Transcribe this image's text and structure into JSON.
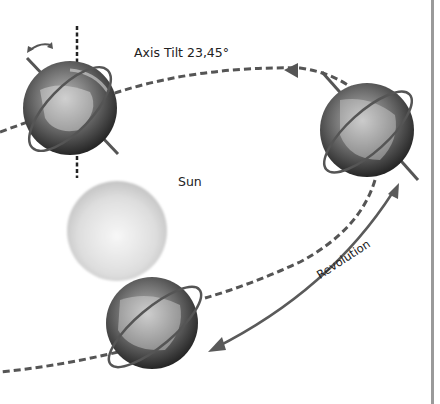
{
  "diagram": {
    "labels": {
      "axis_tilt": "Axis Tilt 23,45°",
      "sun": "Sun",
      "revolution": "Revolution"
    },
    "colors": {
      "orbit_dash": "#555555",
      "arrow": "#5a5a5a",
      "sun_center": "#f4f4f4",
      "sun_edge": "#c9c9c9",
      "earth_dark": "#2e2e2e",
      "earth_light": "#d8d8d8",
      "frame_line": "#9a9a9a"
    },
    "elements": [
      {
        "name": "earth-top-left",
        "role": "Earth with tilted axis and rotation arrow"
      },
      {
        "name": "earth-right",
        "role": "Earth on orbit"
      },
      {
        "name": "earth-bottom",
        "role": "Earth on orbit"
      },
      {
        "name": "sun",
        "role": "Sun"
      }
    ]
  }
}
